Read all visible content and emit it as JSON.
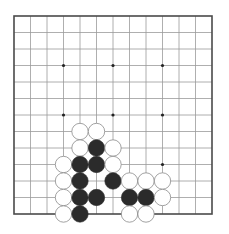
{
  "board": {
    "size": 13,
    "origin_x": 14,
    "origin_y": 16,
    "spacing": 16.5,
    "stone_radius": 8.2,
    "star_radius": 1.6,
    "colors": {
      "background": "#ffffff",
      "grid": "#9a9a9a",
      "border": "#4a4a4a",
      "black_stone": "#2b2b2b",
      "white_stone": "#ffffff",
      "white_outline": "#8a8a8a",
      "star_point": "#222222"
    },
    "star_points": [
      [
        3,
        3
      ],
      [
        6,
        3
      ],
      [
        9,
        3
      ],
      [
        3,
        6
      ],
      [
        6,
        6
      ],
      [
        9,
        6
      ],
      [
        3,
        9
      ],
      [
        6,
        9
      ],
      [
        9,
        9
      ]
    ],
    "stones": [
      {
        "color": "white",
        "col": 4,
        "row": 7
      },
      {
        "color": "white",
        "col": 5,
        "row": 7
      },
      {
        "color": "white",
        "col": 4,
        "row": 8
      },
      {
        "color": "black",
        "col": 5,
        "row": 8
      },
      {
        "color": "white",
        "col": 6,
        "row": 8
      },
      {
        "color": "white",
        "col": 3,
        "row": 9
      },
      {
        "color": "black",
        "col": 4,
        "row": 9
      },
      {
        "color": "black",
        "col": 5,
        "row": 9
      },
      {
        "color": "white",
        "col": 6,
        "row": 9
      },
      {
        "color": "white",
        "col": 3,
        "row": 10
      },
      {
        "color": "black",
        "col": 4,
        "row": 10
      },
      {
        "color": "black",
        "col": 6,
        "row": 10
      },
      {
        "color": "white",
        "col": 7,
        "row": 10
      },
      {
        "color": "white",
        "col": 8,
        "row": 10
      },
      {
        "color": "white",
        "col": 9,
        "row": 10
      },
      {
        "color": "white",
        "col": 3,
        "row": 11
      },
      {
        "color": "black",
        "col": 4,
        "row": 11
      },
      {
        "color": "black",
        "col": 5,
        "row": 11
      },
      {
        "color": "black",
        "col": 7,
        "row": 11
      },
      {
        "color": "black",
        "col": 8,
        "row": 11
      },
      {
        "color": "white",
        "col": 9,
        "row": 11
      },
      {
        "color": "white",
        "col": 3,
        "row": 12
      },
      {
        "color": "black",
        "col": 4,
        "row": 12
      },
      {
        "color": "white",
        "col": 7,
        "row": 12
      },
      {
        "color": "white",
        "col": 8,
        "row": 12
      }
    ]
  }
}
